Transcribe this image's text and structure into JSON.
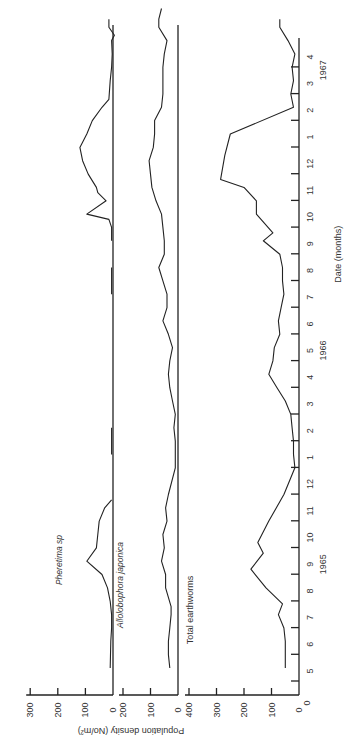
{
  "chart_data": {
    "type": "line",
    "orientation": "rotated-90-ccw",
    "xlabel": "Date (months)",
    "ylabel": "Population density (No/m²)",
    "x_ticks": [
      "5",
      "6",
      "7",
      "8",
      "9",
      "10",
      "11",
      "12",
      "1",
      "2",
      "3",
      "4",
      "5",
      "6",
      "7",
      "8",
      "9",
      "10",
      "11",
      "12",
      "1",
      "2",
      "3",
      "4"
    ],
    "year_labels": [
      {
        "label": "1965",
        "at": 4
      },
      {
        "label": "1966",
        "at": 12
      },
      {
        "label": "1967",
        "at": 22.5
      }
    ],
    "x_unit_note": "x = months since May 1965",
    "panels": [
      {
        "name": "Pheretima sp",
        "ylim": [
          0,
          300
        ],
        "y_ticks": [
          "0",
          "100",
          "200",
          "300"
        ],
        "segments": [
          [
            [
              0,
              10
            ],
            [
              1,
              8
            ],
            [
              1.5,
              5
            ],
            [
              2,
              5
            ],
            [
              2.5,
              10
            ],
            [
              3,
              20
            ],
            [
              3.5,
              40
            ],
            [
              4,
              95
            ],
            [
              4.5,
              60
            ],
            [
              5,
              55
            ],
            [
              5.5,
              50
            ],
            [
              6,
              30
            ],
            [
              6.3,
              5
            ]
          ],
          [
            [
              8,
              5
            ],
            [
              9,
              5
            ]
          ],
          [
            [
              14,
              5
            ],
            [
              15,
              5
            ]
          ],
          [
            [
              16,
              5
            ],
            [
              16.5,
              5
            ],
            [
              16.8,
              15
            ],
            [
              17,
              95
            ],
            [
              17.5,
              25
            ],
            [
              17.8,
              55
            ],
            [
              18,
              60
            ],
            [
              18.5,
              90
            ],
            [
              19,
              110
            ],
            [
              19.5,
              120
            ],
            [
              20,
              95
            ],
            [
              20.5,
              75
            ],
            [
              21,
              40
            ],
            [
              21.3,
              15
            ],
            [
              22,
              10
            ],
            [
              22.5,
              5
            ],
            [
              23,
              3
            ],
            [
              23.5,
              5
            ],
            [
              23.7,
              -5
            ],
            [
              24,
              15
            ],
            [
              24.3,
              15
            ]
          ]
        ]
      },
      {
        "name": "Allolobophora japonica",
        "ylim": [
          0,
          200
        ],
        "y_ticks": [
          "0",
          "100",
          "200"
        ],
        "series": [
          [
            0,
            30
          ],
          [
            0.5,
            35
          ],
          [
            1,
            35
          ],
          [
            1.5,
            30
          ],
          [
            2,
            25
          ],
          [
            2.3,
            25
          ],
          [
            3,
            45
          ],
          [
            3.5,
            45
          ],
          [
            4,
            60
          ],
          [
            4.5,
            50
          ],
          [
            5,
            55
          ],
          [
            5.5,
            40
          ],
          [
            6,
            45
          ],
          [
            6.5,
            35
          ],
          [
            7.5,
            10
          ],
          [
            8,
            10
          ],
          [
            8.5,
            10
          ],
          [
            9,
            15
          ],
          [
            9.5,
            10
          ],
          [
            10,
            20
          ],
          [
            10.5,
            30
          ],
          [
            11,
            35
          ],
          [
            11.5,
            30
          ],
          [
            12,
            20
          ],
          [
            12.5,
            35
          ],
          [
            13,
            55
          ],
          [
            13.5,
            40
          ],
          [
            14,
            40
          ],
          [
            14.5,
            55
          ],
          [
            15,
            70
          ],
          [
            15.5,
            50
          ],
          [
            16,
            50
          ],
          [
            16.5,
            55
          ],
          [
            17,
            60
          ],
          [
            17.5,
            80
          ],
          [
            18,
            95
          ],
          [
            18.5,
            100
          ],
          [
            19,
            105
          ],
          [
            19.5,
            90
          ],
          [
            20,
            85
          ],
          [
            20.5,
            85
          ],
          [
            21,
            60
          ],
          [
            21.5,
            55
          ],
          [
            22,
            55
          ],
          [
            22.5,
            55
          ],
          [
            23,
            50
          ],
          [
            23.5,
            40
          ],
          [
            24,
            70
          ],
          [
            24.3,
            70
          ],
          [
            24.7,
            60
          ]
        ]
      },
      {
        "name": "Total earthworms",
        "ylim": [
          0,
          400
        ],
        "y_ticks": [
          "0",
          "100",
          "200",
          "300",
          "400"
        ],
        "series": [
          [
            0,
            50
          ],
          [
            0.5,
            50
          ],
          [
            1,
            50
          ],
          [
            1.5,
            55
          ],
          [
            2,
            75
          ],
          [
            2.4,
            60
          ],
          [
            3,
            120
          ],
          [
            3.7,
            175
          ],
          [
            4.3,
            130
          ],
          [
            4.7,
            150
          ],
          [
            5.5,
            110
          ],
          [
            6.5,
            55
          ],
          [
            7.5,
            15
          ],
          [
            8,
            20
          ],
          [
            8.5,
            20
          ],
          [
            9,
            25
          ],
          [
            9.5,
            30
          ],
          [
            10,
            50
          ],
          [
            10.5,
            80
          ],
          [
            11,
            110
          ],
          [
            11.5,
            95
          ],
          [
            12,
            90
          ],
          [
            12.5,
            70
          ],
          [
            13,
            75
          ],
          [
            13.5,
            65
          ],
          [
            14,
            55
          ],
          [
            14.5,
            60
          ],
          [
            15,
            60
          ],
          [
            15.5,
            70
          ],
          [
            16,
            130
          ],
          [
            16.3,
            95
          ],
          [
            17,
            155
          ],
          [
            17.5,
            155
          ],
          [
            18,
            200
          ],
          [
            18.3,
            285
          ],
          [
            19.2,
            270
          ],
          [
            20,
            250
          ],
          [
            21,
            20
          ],
          [
            21.5,
            30
          ],
          [
            22,
            20
          ],
          [
            22.5,
            25
          ],
          [
            23,
            15
          ],
          [
            23.5,
            40
          ],
          [
            24,
            70
          ],
          [
            24.3,
            70
          ]
        ]
      }
    ]
  }
}
